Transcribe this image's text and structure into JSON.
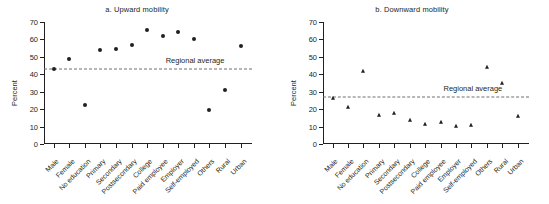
{
  "figure": {
    "panels": [
      {
        "id": "a",
        "title": "a. Upward mobility",
        "ylabel": "Percent",
        "average_label": "Regional average"
      },
      {
        "id": "b",
        "title": "b. Downward mobility",
        "ylabel": "Percent",
        "average_label": "Regional average"
      }
    ]
  },
  "chart_data": [
    {
      "type": "scatter",
      "title": "a. Upward mobility",
      "xlabel": "",
      "ylabel": "Percent",
      "ylim": [
        0,
        70
      ],
      "yticks": [
        0,
        10,
        20,
        30,
        40,
        50,
        60,
        70
      ],
      "ytick_labels": [
        "0",
        "10",
        "20",
        "30",
        "40",
        "50",
        "60",
        "70"
      ],
      "grid": false,
      "legend": false,
      "marker": "circle",
      "marker_color": "#231f20",
      "categories": [
        "Male",
        "Female",
        "No education",
        "Primary",
        "Secondary",
        "Postsecondary",
        "College",
        "Paid employee",
        "Employer",
        "Self-employed",
        "Others",
        "Rural",
        "Urban"
      ],
      "values": [
        43,
        49,
        22.5,
        54,
        54.5,
        57,
        65.5,
        62,
        64.5,
        60.5,
        19.5,
        31,
        56
      ],
      "annotations": [
        {
          "type": "hline",
          "label": "Regional average",
          "value": 43,
          "style": "dashed",
          "color": "#6d6e71"
        }
      ]
    },
    {
      "type": "scatter",
      "title": "b. Downward mobility",
      "xlabel": "",
      "ylabel": "Percent",
      "ylim": [
        0,
        70
      ],
      "yticks": [
        0,
        10,
        20,
        30,
        40,
        50,
        60,
        70
      ],
      "ytick_labels": [
        "0",
        "10",
        "20",
        "30",
        "40",
        "50",
        "60",
        "70"
      ],
      "grid": false,
      "legend": false,
      "marker": "triangle",
      "marker_color": "#231f20",
      "categories": [
        "Male",
        "Female",
        "No education",
        "Primary",
        "Secondary",
        "Postsecondary",
        "College",
        "Paid employee",
        "Employer",
        "Self-employed",
        "Others",
        "Rural",
        "Urban"
      ],
      "values": [
        26.5,
        21.5,
        42,
        16.5,
        18,
        14,
        11.5,
        12.5,
        10.5,
        11,
        44,
        35,
        16
      ],
      "annotations": [
        {
          "type": "hline",
          "label": "Regional average",
          "value": 27,
          "style": "dashed",
          "color": "#6d6e71"
        }
      ]
    }
  ]
}
